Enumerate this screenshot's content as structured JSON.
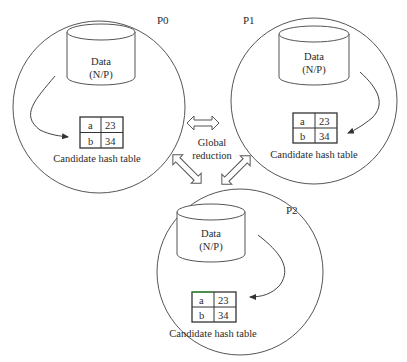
{
  "diagram": {
    "title_fragment": "",
    "processors": [
      {
        "id": "P0",
        "label": "P0",
        "storage": {
          "line1": "Data",
          "line2": "(N/P)"
        },
        "table": {
          "rows": [
            {
              "key": "a",
              "value": "23"
            },
            {
              "key": "b",
              "value": "34"
            }
          ]
        },
        "caption": "Candidate hash table"
      },
      {
        "id": "P1",
        "label": "P1",
        "storage": {
          "line1": "Data",
          "line2": "(N/P)"
        },
        "table": {
          "rows": [
            {
              "key": "a",
              "value": "23"
            },
            {
              "key": "b",
              "value": "34"
            }
          ]
        },
        "caption": "Candidate hash table"
      },
      {
        "id": "P2",
        "label": "P2",
        "storage": {
          "line1": "Data",
          "line2": "(N/P)"
        },
        "table": {
          "rows": [
            {
              "key": "a",
              "value": "23"
            },
            {
              "key": "b",
              "value": "34"
            }
          ]
        },
        "caption": "Candidate hash table"
      }
    ],
    "center": {
      "line1": "Global",
      "line2": "reduction"
    },
    "colors": {
      "stroke": "#4a4a4a",
      "text": "#2b2b2b",
      "background": "#ffffff"
    }
  }
}
